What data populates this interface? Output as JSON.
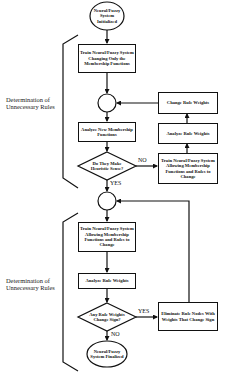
{
  "diagram": {
    "nodes": {
      "start": "Neural/Fuzzy System Initialized",
      "train_mf_only": "Train Neural/Fuzzy System Changing Only the Membership Functions",
      "analyze_mf": "Analyze New Membership Functions",
      "decision_heuristic": "Do They Make Heuristic Sense?",
      "train_all_1": "Train Neural/Fuzzy System Allowing Membership Functions and Rules to Change",
      "analyze_weights_1": "Analyze Rule Weights",
      "change_weights": "Change Rule Weights",
      "train_all_2": "Train Neural/Fuzzy System Allowing Membership Functions and Rules to Change",
      "analyze_weights_2": "Analyze Rule Weights",
      "decision_sign": "Any Rule Weights Change Sign?",
      "eliminate": "Eliminate Rule Nodes With Weights That Change Sign",
      "end": "Neural/Fuzzy System Finalized"
    },
    "edge_labels": {
      "heuristic_no": "NO",
      "heuristic_yes": "YES",
      "sign_yes": "YES",
      "sign_no": "NO"
    },
    "brackets": [
      {
        "label": "Determination of Unnecessary Rules"
      },
      {
        "label": "Determination of Unnecessary Rules"
      }
    ]
  }
}
